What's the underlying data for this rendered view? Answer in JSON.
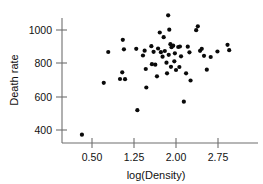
{
  "chart_data": {
    "type": "scatter",
    "title": "",
    "xlabel": "log(Density)",
    "ylabel": "Death rate",
    "xticks": [
      0.5,
      1.25,
      2.0,
      2.75
    ],
    "xtick_labels": [
      "0.50",
      "1.25",
      "2.00",
      "2.75"
    ],
    "yticks": [
      400,
      600,
      800,
      1000
    ],
    "ytick_labels": [
      "400",
      "600",
      "800",
      "1000"
    ],
    "xlim": [
      0.15,
      3.15
    ],
    "ylim": [
      340,
      1110
    ],
    "grid": false,
    "legend": null,
    "marker": "filled-circle",
    "marker_color": "#0a0a0a",
    "n_points": 56,
    "points": [
      {
        "x": 0.32,
        "y": 372
      },
      {
        "x": 0.79,
        "y": 868
      },
      {
        "x": 0.71,
        "y": 683
      },
      {
        "x": 1.05,
        "y": 941
      },
      {
        "x": 1.07,
        "y": 884
      },
      {
        "x": 1.04,
        "y": 746
      },
      {
        "x": 1.0,
        "y": 706
      },
      {
        "x": 1.09,
        "y": 705
      },
      {
        "x": 1.29,
        "y": 887
      },
      {
        "x": 1.31,
        "y": 519
      },
      {
        "x": 1.44,
        "y": 876
      },
      {
        "x": 1.41,
        "y": 847
      },
      {
        "x": 1.46,
        "y": 766
      },
      {
        "x": 1.47,
        "y": 655
      },
      {
        "x": 1.56,
        "y": 903
      },
      {
        "x": 1.6,
        "y": 869
      },
      {
        "x": 1.57,
        "y": 795
      },
      {
        "x": 1.63,
        "y": 792
      },
      {
        "x": 1.71,
        "y": 985
      },
      {
        "x": 1.68,
        "y": 889
      },
      {
        "x": 1.73,
        "y": 867
      },
      {
        "x": 1.66,
        "y": 722
      },
      {
        "x": 1.78,
        "y": 957
      },
      {
        "x": 1.8,
        "y": 874
      },
      {
        "x": 1.76,
        "y": 840
      },
      {
        "x": 1.83,
        "y": 804
      },
      {
        "x": 1.86,
        "y": 1088
      },
      {
        "x": 1.88,
        "y": 1002
      },
      {
        "x": 1.9,
        "y": 915
      },
      {
        "x": 1.92,
        "y": 897
      },
      {
        "x": 1.87,
        "y": 851
      },
      {
        "x": 1.91,
        "y": 779
      },
      {
        "x": 1.84,
        "y": 740
      },
      {
        "x": 1.95,
        "y": 906
      },
      {
        "x": 1.98,
        "y": 860
      },
      {
        "x": 1.97,
        "y": 812
      },
      {
        "x": 2.0,
        "y": 760
      },
      {
        "x": 2.04,
        "y": 898
      },
      {
        "x": 2.07,
        "y": 901
      },
      {
        "x": 2.09,
        "y": 842
      },
      {
        "x": 2.06,
        "y": 778
      },
      {
        "x": 2.14,
        "y": 570
      },
      {
        "x": 2.21,
        "y": 900
      },
      {
        "x": 2.24,
        "y": 866
      },
      {
        "x": 2.18,
        "y": 740
      },
      {
        "x": 2.26,
        "y": 697
      },
      {
        "x": 2.39,
        "y": 1022
      },
      {
        "x": 2.36,
        "y": 999
      },
      {
        "x": 2.43,
        "y": 875
      },
      {
        "x": 2.46,
        "y": 887
      },
      {
        "x": 2.5,
        "y": 845
      },
      {
        "x": 2.55,
        "y": 762
      },
      {
        "x": 2.62,
        "y": 838
      },
      {
        "x": 2.74,
        "y": 871
      },
      {
        "x": 2.92,
        "y": 911
      },
      {
        "x": 2.95,
        "y": 879
      }
    ]
  },
  "colors": {
    "marker": "#0a0a0a",
    "axis": "#6f6f6f",
    "text": "#111111",
    "background": "#ffffff"
  }
}
